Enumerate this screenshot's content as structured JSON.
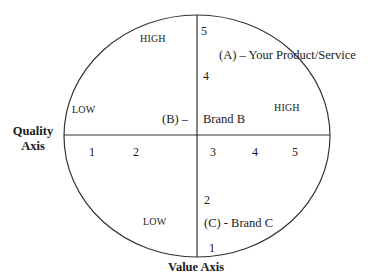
{
  "diagram": {
    "type": "perceptual map",
    "line_color": "#333333",
    "axes": {
      "horizontal": {
        "label_line1": "Quality",
        "label_line2": "Axis",
        "ticks": [
          "1",
          "2",
          "3",
          "4",
          "5"
        ],
        "low_label": "LOW",
        "high_label": "HIGH"
      },
      "vertical": {
        "label": "Value Axis",
        "ticks_top": [
          "5",
          "4"
        ],
        "ticks_bottom": [
          "2",
          "1"
        ],
        "low_label": "LOW",
        "high_label": "HIGH"
      }
    },
    "points": [
      {
        "id": "A",
        "label": "(A) – Your Product/Service"
      },
      {
        "id": "B",
        "label_prefix": "(B) –",
        "label_suffix": "Brand B"
      },
      {
        "id": "C",
        "label": "(C) - Brand C"
      }
    ]
  }
}
